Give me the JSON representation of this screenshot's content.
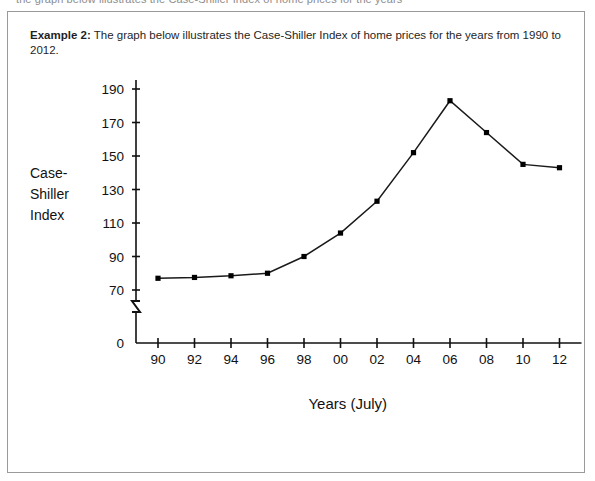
{
  "top_cut_text": "the graph below illustrates the Case-Shiller Index of home prices for the years",
  "caption": {
    "label": "Example 2:",
    "text": " The graph below illustrates the Case-Shiller Index of home prices for the years from 1990 to 2012."
  },
  "chart_data": {
    "type": "line",
    "title": "",
    "xlabel": "Years (July)",
    "ylabel": "Case-Shiller Index",
    "ylabel_lines": [
      "Case-",
      "Shiller",
      "Index"
    ],
    "categories": [
      "90",
      "92",
      "94",
      "96",
      "98",
      "00",
      "02",
      "04",
      "06",
      "08",
      "10",
      "12"
    ],
    "x_full_years": [
      1990,
      1992,
      1994,
      1996,
      1998,
      2000,
      2002,
      2004,
      2006,
      2008,
      2010,
      2012
    ],
    "values": [
      77,
      77.5,
      78.5,
      80,
      90,
      104,
      123,
      152,
      183,
      164,
      145,
      143
    ],
    "series": [
      {
        "name": "Case-Shiller Index",
        "values": [
          77,
          77.5,
          78.5,
          80,
          90,
          104,
          123,
          152,
          183,
          164,
          145,
          143
        ]
      }
    ],
    "yticks": [
      0,
      70,
      90,
      110,
      130,
      150,
      170,
      190
    ],
    "ytick_labels": [
      "0",
      "70",
      "90",
      "110",
      "130",
      "150",
      "170",
      "190"
    ],
    "ylim": [
      0,
      190
    ],
    "xlim": [
      "90",
      "12"
    ],
    "axis_break": true,
    "axis_break_symbol": "zigzag",
    "grid": false,
    "legend": "none",
    "marker": "square",
    "line_color": "#1a1a1a",
    "marker_color": "#000000"
  },
  "colors": {
    "frame_border": "#9a9a9a",
    "axis": "#111111",
    "text": "#1f1f1f",
    "background": "#ffffff"
  }
}
